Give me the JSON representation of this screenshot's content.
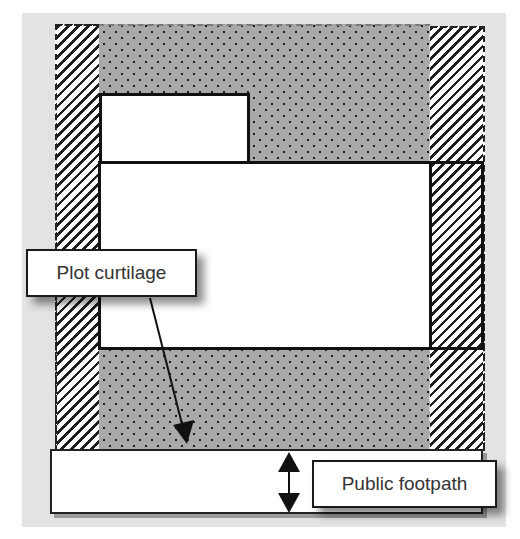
{
  "diagram": {
    "type": "site-plan",
    "labels": {
      "plot_curtilage": "Plot curtilage",
      "public_footpath": "Public footpath"
    },
    "regions": [
      {
        "name": "left-side-strip",
        "pattern": "diagonal-hatch"
      },
      {
        "name": "right-side-strip",
        "pattern": "diagonal-hatch"
      },
      {
        "name": "garden-area",
        "pattern": "dotted-grey"
      },
      {
        "name": "outbuilding",
        "pattern": "white"
      },
      {
        "name": "dwelling",
        "pattern": "white"
      },
      {
        "name": "dwelling-extension",
        "pattern": "diagonal-hatch"
      },
      {
        "name": "public-footpath",
        "pattern": "white"
      }
    ],
    "arrows": [
      {
        "from": "Plot curtilage",
        "to": "garden-area",
        "style": "single-head"
      },
      {
        "at": "public-footpath",
        "style": "double-head",
        "meaning": "footpath width"
      }
    ],
    "colors": {
      "background": "#e3e3e3",
      "dot_fill": "#a9a9a9",
      "line": "#111111",
      "label_text": "#333333"
    }
  }
}
